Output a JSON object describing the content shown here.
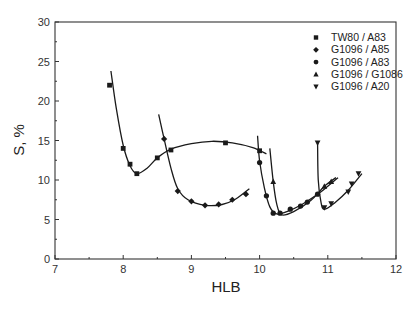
{
  "chart_data": {
    "type": "line",
    "title": "",
    "xlabel": "HLB",
    "ylabel": "S, %",
    "xlim": [
      7,
      12
    ],
    "ylim": [
      0,
      30
    ],
    "xticks": [
      7,
      8,
      9,
      10,
      11,
      12
    ],
    "yticks": [
      0,
      5,
      10,
      15,
      20,
      25,
      30
    ],
    "grid": false,
    "legend_position": "upper right",
    "series": [
      {
        "name": "TW80 / A83",
        "marker": "square",
        "points": [
          [
            7.8,
            22.0
          ],
          [
            8.0,
            14.0
          ],
          [
            8.1,
            12.0
          ],
          [
            8.2,
            10.8
          ],
          [
            8.5,
            12.8
          ],
          [
            8.7,
            13.8
          ],
          [
            9.5,
            14.7
          ],
          [
            10.0,
            13.7
          ]
        ],
        "curve": [
          [
            7.82,
            23.8
          ],
          [
            7.9,
            19.0
          ],
          [
            8.0,
            14.4
          ],
          [
            8.1,
            11.8
          ],
          [
            8.2,
            10.8
          ],
          [
            8.35,
            11.5
          ],
          [
            8.5,
            12.8
          ],
          [
            8.7,
            13.9
          ],
          [
            9.0,
            14.6
          ],
          [
            9.3,
            14.9
          ],
          [
            9.6,
            14.7
          ],
          [
            9.9,
            14.1
          ],
          [
            10.1,
            13.3
          ]
        ]
      },
      {
        "name": "G1096 / A85",
        "marker": "diamond",
        "points": [
          [
            8.6,
            15.2
          ],
          [
            8.8,
            8.6
          ],
          [
            9.0,
            7.3
          ],
          [
            9.2,
            6.8
          ],
          [
            9.4,
            6.9
          ],
          [
            9.6,
            7.5
          ],
          [
            9.8,
            8.2
          ]
        ],
        "curve": [
          [
            8.52,
            18.3
          ],
          [
            8.6,
            15.2
          ],
          [
            8.7,
            11.5
          ],
          [
            8.8,
            8.9
          ],
          [
            8.95,
            7.5
          ],
          [
            9.2,
            6.8
          ],
          [
            9.45,
            6.9
          ],
          [
            9.65,
            7.6
          ],
          [
            9.85,
            8.9
          ]
        ]
      },
      {
        "name": "G1096 / A83",
        "marker": "circle",
        "points": [
          [
            10.0,
            12.2
          ],
          [
            10.1,
            8.0
          ],
          [
            10.2,
            5.8
          ],
          [
            10.3,
            5.8
          ],
          [
            10.45,
            6.3
          ],
          [
            10.6,
            6.7
          ],
          [
            10.7,
            7.2
          ],
          [
            10.85,
            8.2
          ]
        ],
        "curve": [
          [
            9.97,
            15.6
          ],
          [
            10.0,
            12.4
          ],
          [
            10.07,
            9.0
          ],
          [
            10.15,
            6.6
          ],
          [
            10.25,
            5.7
          ],
          [
            10.4,
            6.0
          ],
          [
            10.6,
            6.8
          ],
          [
            10.85,
            8.2
          ],
          [
            11.0,
            9.2
          ],
          [
            11.15,
            10.3
          ]
        ]
      },
      {
        "name": "G1096 / G1086",
        "marker": "triangle-up",
        "points": [
          [
            10.2,
            9.8
          ],
          [
            10.95,
            9.2
          ],
          [
            11.05,
            9.8
          ]
        ],
        "curve": [
          [
            10.15,
            14.0
          ],
          [
            10.2,
            9.8
          ],
          [
            10.25,
            7.0
          ],
          [
            10.32,
            5.6
          ],
          [
            10.5,
            6.0
          ],
          [
            10.75,
            7.4
          ],
          [
            10.95,
            9.2
          ],
          [
            11.12,
            10.3
          ]
        ]
      },
      {
        "name": "G1096 / A20",
        "marker": "triangle-down",
        "points": [
          [
            10.85,
            14.7
          ],
          [
            10.95,
            6.5
          ],
          [
            11.05,
            7.0
          ],
          [
            11.3,
            8.5
          ],
          [
            11.35,
            9.5
          ],
          [
            11.45,
            10.8
          ]
        ],
        "curve": [
          [
            10.85,
            14.9
          ],
          [
            10.86,
            10.0
          ],
          [
            10.9,
            7.2
          ],
          [
            10.95,
            6.3
          ],
          [
            11.1,
            7.1
          ],
          [
            11.3,
            8.7
          ],
          [
            11.5,
            10.8
          ]
        ]
      }
    ]
  },
  "legend": {
    "items": [
      {
        "label": "TW80  / A83",
        "marker": "square"
      },
      {
        "label": "G1096 / A85",
        "marker": "diamond"
      },
      {
        "label": "G1096 / A83",
        "marker": "circle"
      },
      {
        "label": "G1096 / G1086",
        "marker": "triangle-up"
      },
      {
        "label": "G1096 / A20",
        "marker": "triangle-down"
      }
    ]
  },
  "axes": {
    "x_title": "HLB",
    "y_title": "S, %",
    "x_tick_labels": [
      "7",
      "8",
      "9",
      "10",
      "11",
      "12"
    ],
    "y_tick_labels": [
      "0",
      "5",
      "10",
      "15",
      "20",
      "25",
      "30"
    ]
  },
  "colors": {
    "line": "#1a1a1a",
    "frame": "#333333",
    "background": "#ffffff"
  }
}
